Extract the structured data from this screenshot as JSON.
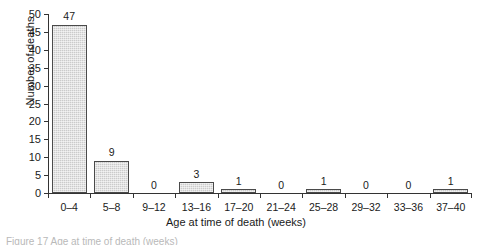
{
  "chart_data": {
    "type": "bar",
    "title": "",
    "subtitle": "",
    "xlabel": "Age at time of death (weeks)",
    "ylabel": "Number of deaths",
    "categories": [
      "0–4",
      "5–8",
      "9–12",
      "13–16",
      "17–20",
      "21–24",
      "25–28",
      "29–32",
      "33–36",
      "37–40"
    ],
    "values": [
      47,
      9,
      0,
      3,
      1,
      0,
      1,
      0,
      0,
      1
    ],
    "value_labels": [
      "47",
      "9",
      "0",
      "3",
      "1",
      "0",
      "1",
      "0",
      "0",
      "1"
    ],
    "ylim": [
      0,
      50
    ],
    "ytick_values": [
      0,
      5,
      10,
      15,
      20,
      25,
      30,
      35,
      40,
      45,
      50
    ],
    "ytick_labels": [
      "0",
      "5",
      "10",
      "15",
      "20",
      "25",
      "30",
      "35",
      "40",
      "45",
      "50"
    ],
    "grid": false,
    "legend": false,
    "legend_position": "none",
    "bar_fill_color": "#cbcbcb",
    "bar_edge_color": "#4a4a4a",
    "axis_color": "#333333",
    "text_color": "#1a1a1a"
  },
  "caption": {
    "text": "Figure 17    Age at time of death (weeks)"
  }
}
